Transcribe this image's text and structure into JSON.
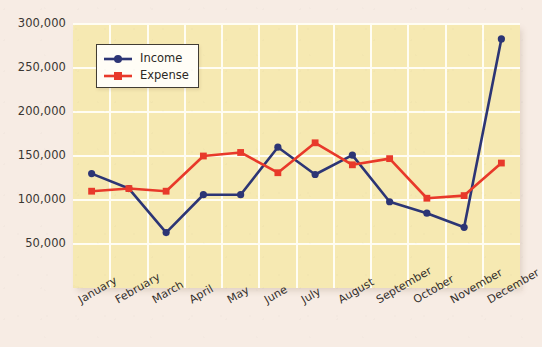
{
  "chart_data": {
    "type": "line",
    "title": "",
    "xlabel": "",
    "ylabel": "",
    "categories": [
      "January",
      "February",
      "March",
      "April",
      "May",
      "June",
      "July",
      "August",
      "September",
      "October",
      "November",
      "December"
    ],
    "series": [
      {
        "name": "Income",
        "color": "#2c3575",
        "marker": "circle",
        "values": [
          130000,
          113000,
          63000,
          106000,
          106000,
          160000,
          129000,
          151000,
          98000,
          85000,
          69000,
          283000
        ]
      },
      {
        "name": "Expense",
        "color": "#e8392a",
        "marker": "square",
        "values": [
          110000,
          113000,
          110000,
          150000,
          154000,
          131000,
          165000,
          140000,
          147000,
          102000,
          105000,
          142000
        ]
      }
    ],
    "ylim": [
      0,
      300000
    ],
    "y_ticks": [
      50000,
      100000,
      150000,
      200000,
      250000,
      300000
    ],
    "y_tick_labels": [
      "50,000",
      "100,000",
      "150,000",
      "200,000",
      "250,000",
      "300,000"
    ],
    "grid": true,
    "legend_position": "upper-left",
    "plot_background": "#f6e9b2",
    "page_background": "#f7ece4",
    "gridline_color": "#fffdf3"
  }
}
